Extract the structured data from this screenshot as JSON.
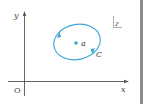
{
  "diagram": {
    "axes": {
      "x_label": "x",
      "y_label": "y",
      "origin_label": "O"
    },
    "plane_label": "z",
    "contour": {
      "label": "C",
      "shape": "ellipse",
      "orientation": "counterclockwise"
    },
    "point": {
      "label": "a"
    },
    "colors": {
      "axis": "#555555",
      "contour": "#3aa6d6",
      "text": "#444444",
      "side_bar": "#8c8c8c"
    }
  }
}
